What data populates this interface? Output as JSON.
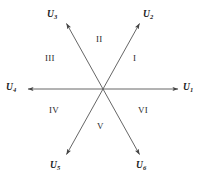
{
  "figure": {
    "type": "vector-sector-diagram",
    "background_color": "#ffffff",
    "line_color": "#555555",
    "text_color": "#1a1a1a",
    "center": {
      "x": 103,
      "y": 89
    }
  },
  "vectors": [
    {
      "id": "u1",
      "symbol": "U",
      "subscript": "1",
      "angle_deg": 0,
      "tip": {
        "x": 181,
        "y": 89
      },
      "label_pos": {
        "x": 183,
        "y": 83
      }
    },
    {
      "id": "u2",
      "symbol": "U",
      "subscript": "2",
      "angle_deg": 60,
      "tip": {
        "x": 141,
        "y": 21
      },
      "label_pos": {
        "x": 143,
        "y": 10
      }
    },
    {
      "id": "u3",
      "symbol": "U",
      "subscript": "3",
      "angle_deg": 120,
      "tip": {
        "x": 65,
        "y": 21
      },
      "label_pos": {
        "x": 47,
        "y": 10
      }
    },
    {
      "id": "u4",
      "symbol": "U",
      "subscript": "4",
      "angle_deg": 180,
      "tip": {
        "x": 25,
        "y": 89
      },
      "label_pos": {
        "x": 6,
        "y": 83
      }
    },
    {
      "id": "u5",
      "symbol": "U",
      "subscript": "5",
      "angle_deg": 240,
      "tip": {
        "x": 65,
        "y": 157
      },
      "label_pos": {
        "x": 50,
        "y": 161
      }
    },
    {
      "id": "u6",
      "symbol": "U",
      "subscript": "6",
      "angle_deg": 300,
      "tip": {
        "x": 141,
        "y": 157
      },
      "label_pos": {
        "x": 136,
        "y": 161
      }
    }
  ],
  "sectors": [
    {
      "id": "sector-1",
      "numeral": "I",
      "pos": {
        "x": 133,
        "y": 54
      }
    },
    {
      "id": "sector-2",
      "numeral": "II",
      "pos": {
        "x": 96,
        "y": 35
      }
    },
    {
      "id": "sector-3",
      "numeral": "III",
      "pos": {
        "x": 45,
        "y": 54
      }
    },
    {
      "id": "sector-4",
      "numeral": "IV",
      "pos": {
        "x": 49,
        "y": 106
      }
    },
    {
      "id": "sector-5",
      "numeral": "V",
      "pos": {
        "x": 97,
        "y": 122
      }
    },
    {
      "id": "sector-6",
      "numeral": "VI",
      "pos": {
        "x": 138,
        "y": 106
      }
    }
  ]
}
